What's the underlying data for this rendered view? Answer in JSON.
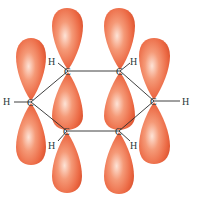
{
  "diagram": {
    "colors": {
      "lobe_edge": "#d9502c",
      "lobe_mid": "#ee7550",
      "lobe_highlight": "#fde3d6",
      "bond": "#2b2b2b",
      "label": "#2a3a3a"
    },
    "atoms": [
      {
        "id": "C1",
        "label": "C",
        "x": 68,
        "y": 71
      },
      {
        "id": "C2",
        "label": "C",
        "x": 120,
        "y": 71
      },
      {
        "id": "C3",
        "label": "C",
        "x": 154,
        "y": 101
      },
      {
        "id": "C4",
        "label": "C",
        "x": 119,
        "y": 131
      },
      {
        "id": "C5",
        "label": "C",
        "x": 67,
        "y": 131
      },
      {
        "id": "C6",
        "label": "C",
        "x": 31,
        "y": 102
      }
    ],
    "hydrogens": [
      {
        "label": "H",
        "x": 52,
        "y": 64
      },
      {
        "label": "H",
        "x": 134,
        "y": 64
      },
      {
        "label": "H",
        "x": 186,
        "y": 104
      },
      {
        "label": "H",
        "x": 134,
        "y": 148
      },
      {
        "label": "H",
        "x": 52,
        "y": 148
      },
      {
        "label": "H",
        "x": 7,
        "y": 105
      }
    ],
    "labels": {
      "h1": "H",
      "h2": "H",
      "h3": "H",
      "h4": "H",
      "h5": "H",
      "h6": "H",
      "c1": "C",
      "c2": "C",
      "c3": "C",
      "c4": "C",
      "c5": "C",
      "c6": "C"
    }
  }
}
